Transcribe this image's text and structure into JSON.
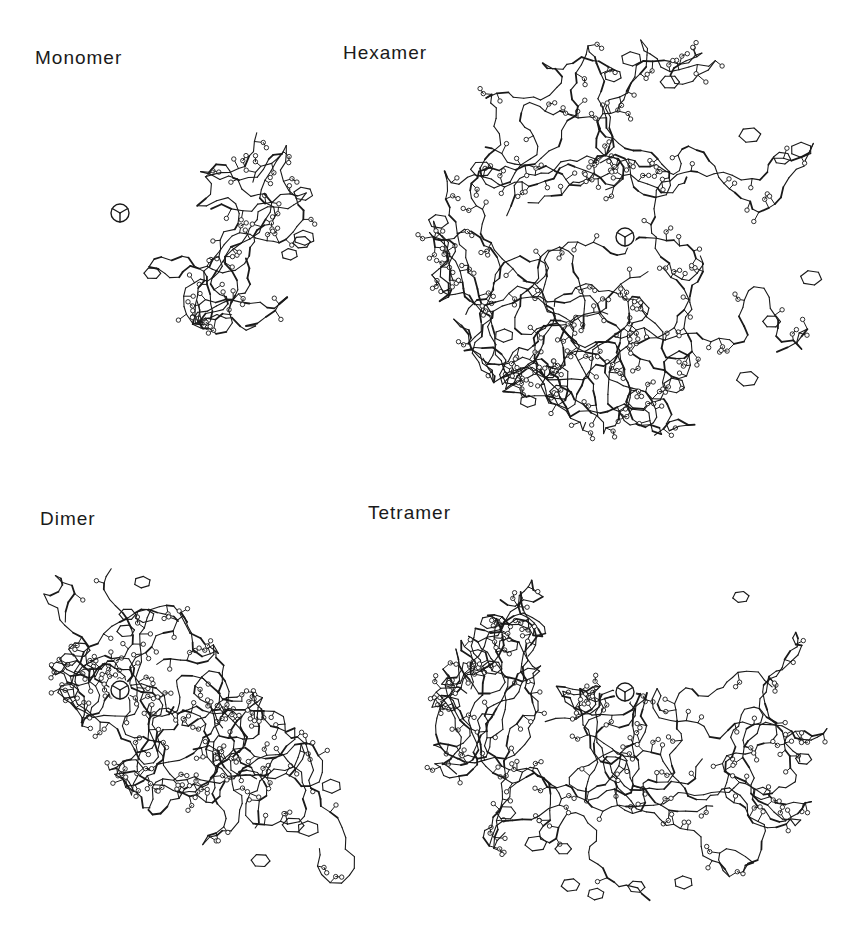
{
  "figure": {
    "background": "#ffffff",
    "ink": "#1a1a1a",
    "panels": [
      {
        "id": "monomer",
        "label": "Monomer",
        "label_pos": [
          35,
          47
        ],
        "axis_symbol": [
          110,
          203
        ],
        "region": {
          "cx": 225,
          "cy": 225,
          "shape": "blob",
          "rx": 90,
          "ry": 110
        },
        "subunits": 1
      },
      {
        "id": "hexamer",
        "label": "Hexamer",
        "label_pos": [
          343,
          42
        ],
        "axis_symbol": [
          615,
          227
        ],
        "region": {
          "cx": 633,
          "cy": 237,
          "shape": "disc",
          "rx": 205,
          "ry": 200
        },
        "subunits": 6
      },
      {
        "id": "dimer",
        "label": "Dimer",
        "label_pos": [
          40,
          508
        ],
        "axis_symbol": [
          110,
          680
        ],
        "region": {
          "cx": 200,
          "cy": 730,
          "shape": "crescent",
          "rx": 150,
          "ry": 170
        },
        "subunits": 2
      },
      {
        "id": "tetramer",
        "label": "Tetramer",
        "label_pos": [
          368,
          502
        ],
        "axis_symbol": [
          615,
          682
        ],
        "region": {
          "cx": 630,
          "cy": 730,
          "shape": "bowl",
          "rx": 200,
          "ry": 175
        },
        "subunits": 4
      }
    ]
  }
}
